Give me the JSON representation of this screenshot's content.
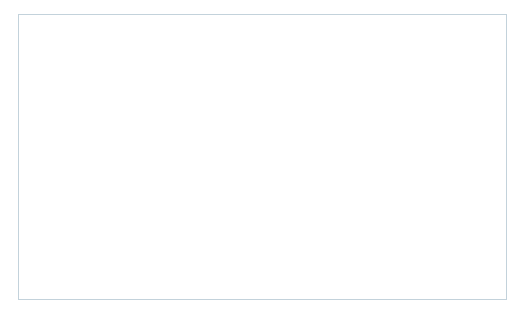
{
  "chart_data": {
    "type": "line",
    "title": "",
    "xlabel": "",
    "ylabel": "Volume",
    "xlim": [
      1980,
      2004
    ],
    "ylim": [
      0,
      350000000
    ],
    "grid": false,
    "legend_position": "upper-left-inside",
    "x": [
      1980,
      1981,
      1982,
      1983,
      1984,
      1985,
      1986,
      1987,
      1988,
      1989,
      1990,
      1991,
      1992,
      1993,
      1994,
      1995,
      1996,
      1997,
      1998,
      1999,
      2000,
      2001,
      2002,
      2003,
      2004
    ],
    "xtick_labels": [
      "1980",
      "1984",
      "1988",
      "1992",
      "1996",
      "2000",
      "2004"
    ],
    "xtick_values": [
      1980,
      1984,
      1988,
      1992,
      1996,
      2000,
      2004
    ],
    "ytick_labels": [
      "0",
      "50,000,000",
      "100,000,000",
      "150,000,000",
      "200,000,000",
      "250,000,000",
      "300,000,000",
      "350,000,000"
    ],
    "ytick_values": [
      0,
      50000000,
      100000000,
      150000000,
      200000000,
      250000000,
      300000000,
      350000000
    ],
    "series": [
      {
        "name": "3-month Eurodollar",
        "color": "#8ea0b4",
        "width": 2.6,
        "values": [
          0,
          0,
          0,
          0,
          1000000,
          4000000,
          11000000,
          18000000,
          20000000,
          42000000,
          38000000,
          37000000,
          61000000,
          66000000,
          113000000,
          104000000,
          98000000,
          105000000,
          108000000,
          93000000,
          107000000,
          184000000,
          199000000,
          209000000,
          295000000
        ]
      },
      {
        "name": "U.S. Treasury Bond",
        "color": "#000000",
        "width": 2.8,
        "values": [
          3000000,
          9000000,
          13000000,
          16000000,
          20000000,
          30000000,
          40000000,
          53000000,
          71000000,
          70000000,
          75000000,
          68000000,
          71000000,
          80000000,
          100000000,
          87000000,
          85000000,
          80000000,
          110000000,
          90000000,
          63000000,
          32000000,
          22000000,
          15000000,
          3000000
        ]
      }
    ]
  },
  "legend": {
    "items": [
      {
        "label": "3-month Eurodollar",
        "color": "#8ea0b4"
      },
      {
        "label": "U.S. Treasury Bond",
        "color": "#000000"
      }
    ]
  },
  "colors": {
    "eurodollar": "#8ea0b4",
    "treasury": "#000000",
    "frame_border": "#c3d2db",
    "axis": "#6f7b83",
    "background": "#ffffff"
  }
}
